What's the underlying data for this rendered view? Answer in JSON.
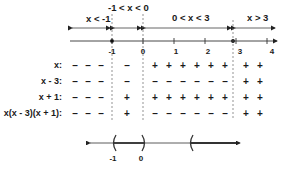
{
  "intervals": [
    {
      "label": "x < -1"
    },
    {
      "label": "-1 < x < 0"
    },
    {
      "label": "0 < x < 3"
    },
    {
      "label": "x > 3"
    }
  ],
  "number_line": {
    "ticks": [
      {
        "value": "-1"
      },
      {
        "value": "0"
      },
      {
        "value": "1"
      },
      {
        "value": "2"
      },
      {
        "value": "3"
      },
      {
        "value": "4"
      }
    ],
    "closed_points": [
      "-1",
      "3"
    ]
  },
  "sign_rows": [
    {
      "label": "x:",
      "signs": [
        "-",
        "-",
        "-",
        "-",
        "+",
        "+",
        "+",
        "+",
        "+",
        "+",
        "+",
        "+"
      ]
    },
    {
      "label": "x - 3:",
      "signs": [
        "-",
        "-",
        "-",
        "-",
        "-",
        "-",
        "-",
        "-",
        "-",
        "-",
        "+",
        "+"
      ]
    },
    {
      "label": "x + 1:",
      "signs": [
        "-",
        "-",
        "-",
        "+",
        "+",
        "+",
        "+",
        "+",
        "+",
        "+",
        "+",
        "+"
      ]
    },
    {
      "label": "x(x - 3)(x + 1):",
      "signs": [
        "-",
        "-",
        "-",
        "+",
        "-",
        "-",
        "-",
        "-",
        "-",
        "-",
        "+",
        "+"
      ]
    }
  ],
  "solution_line": {
    "labels": [
      "-1",
      "0"
    ]
  }
}
